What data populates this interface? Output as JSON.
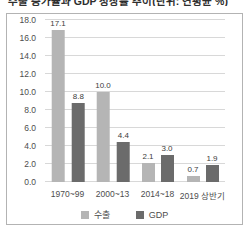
{
  "title": {
    "text_clipped": "수출 증가율과 GDP 성장률 추이(단위: 연평균 %)"
  },
  "chart_data": {
    "type": "bar",
    "categories": [
      "1970~99",
      "2000~13",
      "2014~18",
      "2019 상반기"
    ],
    "series": [
      {
        "name": "수출",
        "color": "#b5b5b5",
        "values": [
          17.1,
          10.0,
          2.1,
          0.7
        ]
      },
      {
        "name": "GDP",
        "color": "#6b6b6b",
        "values": [
          8.8,
          4.4,
          3.0,
          1.9
        ]
      }
    ],
    "ylim": [
      0,
      18
    ],
    "ytick_step": 2,
    "ytick_labels": [
      "0.0",
      "2.0",
      "4.0",
      "6.0",
      "8.0",
      "10.0",
      "12.0",
      "14.0",
      "16.0",
      "18.0"
    ],
    "value_label_decimals": 1,
    "grid": true,
    "legend_position": "bottom"
  },
  "colors": {
    "box_border": "#b3b3b3",
    "gridline": "#d8d8d8",
    "axis_text": "#4d4d4d",
    "value_label_text": "#3d3d3d",
    "background": "#ffffff"
  }
}
